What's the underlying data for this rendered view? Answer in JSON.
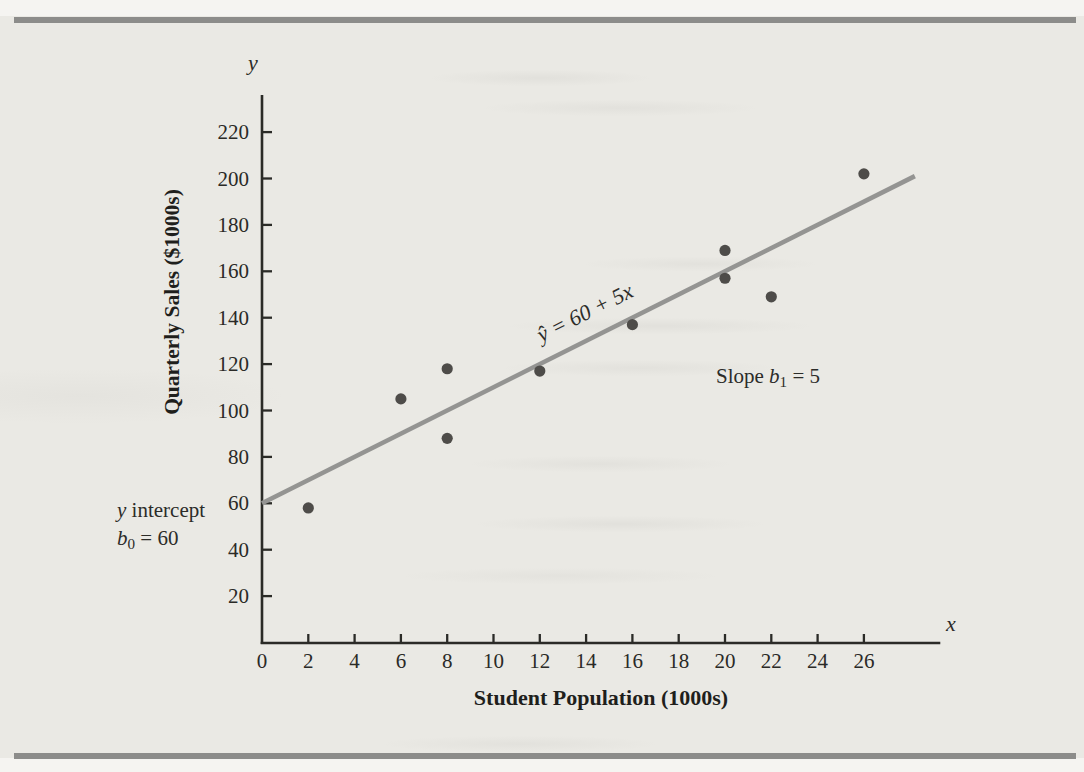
{
  "page": {
    "paper_color": "#eae9e4",
    "rule_color": "#8c8c8a"
  },
  "axes": {
    "x_letter": "x",
    "y_letter": "y",
    "x_title": "Student Population (1000s)",
    "y_title": "Quarterly Sales ($1000s)"
  },
  "annotations": {
    "equation_label": "ŷ = 60 + 5x",
    "slope_label": {
      "before": "Slope ",
      "sym": "b",
      "sub": "1",
      "after": " = 5"
    },
    "intercept_label": {
      "sym1": "y",
      "rest1": " intercept",
      "sym2": "b",
      "sub2": "0",
      "rest2": " = 60"
    }
  },
  "chart_data": {
    "type": "scatter",
    "title": "",
    "xlabel": "Student Population (1000s)",
    "ylabel": "Quarterly Sales ($1000s)",
    "x_ticks": [
      0,
      2,
      4,
      6,
      8,
      10,
      12,
      14,
      16,
      18,
      20,
      22,
      24,
      26
    ],
    "y_ticks": [
      20,
      40,
      60,
      80,
      100,
      120,
      140,
      160,
      180,
      200,
      220
    ],
    "xlim": [
      0,
      29.3
    ],
    "ylim": [
      0,
      236
    ],
    "grid": false,
    "points": [
      {
        "x": 2,
        "y": 58
      },
      {
        "x": 6,
        "y": 105
      },
      {
        "x": 8,
        "y": 88
      },
      {
        "x": 8,
        "y": 118
      },
      {
        "x": 12,
        "y": 117
      },
      {
        "x": 16,
        "y": 137
      },
      {
        "x": 20,
        "y": 157
      },
      {
        "x": 20,
        "y": 169
      },
      {
        "x": 22,
        "y": 149
      },
      {
        "x": 26,
        "y": 202
      }
    ],
    "regression_line": {
      "equation": "ŷ = 60 + 5x",
      "intercept": 60,
      "slope": 5,
      "x_start": 0,
      "x_end": 28.2
    },
    "colors": {
      "axis": "#2b2b27",
      "tick_text": "#2a2a27",
      "point": "#4e4c49",
      "line": "#949492"
    }
  }
}
